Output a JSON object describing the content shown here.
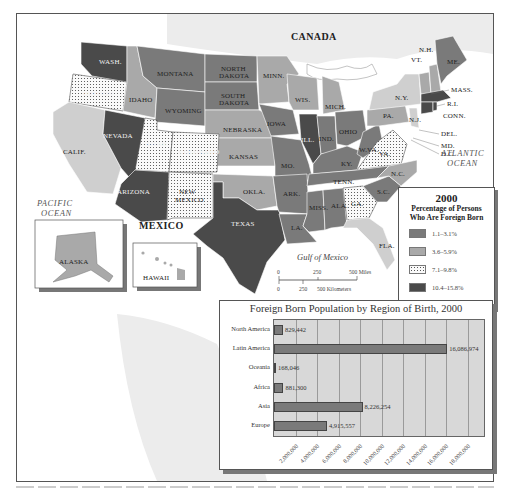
{
  "map": {
    "labels": {
      "canada": "CANADA",
      "mexico": "MEXICO",
      "pacific": [
        "PACIFIC",
        "OCEAN"
      ],
      "atlantic": [
        "ATLANTIC",
        "OCEAN"
      ],
      "gulf": "Gulf of Mexico"
    },
    "states": {
      "wash": "WASH.",
      "oregon": "OREGON",
      "idaho": "IDAHO",
      "montana": "MONTANA",
      "nd": [
        "NORTH",
        "DAKOTA"
      ],
      "sd": [
        "SOUTH",
        "DAKOTA"
      ],
      "wyoming": "WYOMING",
      "minn": "MINN.",
      "wis": "WIS.",
      "mich": "MICH.",
      "nevada": "NEVADA",
      "utah": "UTAH",
      "colorado": "COLORADO",
      "nebraska": "NEBRASKA",
      "kansas": "KANSAS",
      "iowa": "IOWA",
      "ill": "ILL.",
      "ind": "IND.",
      "ohio": "OHIO",
      "calif": "CALIF.",
      "arizona": "ARIZONA",
      "nm": [
        "NEW",
        "MEXICO"
      ],
      "okla": "OKLA.",
      "texas": "TEXAS",
      "mo": "MO.",
      "ark": "ARK.",
      "la": "LA.",
      "miss": "MISS.",
      "ala": "ALA.",
      "tenn": "TENN.",
      "ky": "KY.",
      "wva": "W.VA.",
      "va": "VA.",
      "nc": "N.C.",
      "sc": "S.C.",
      "ga": "GA.",
      "fla": "FLA.",
      "pa": "PA.",
      "ny": "N.Y.",
      "nj": "N.J.",
      "del": "DEL.",
      "md": "MD.",
      "dc": "D.C.",
      "conn": "CONN.",
      "ri": "R.I.",
      "mass": "MASS.",
      "vt": "VT.",
      "nh": "N.H.",
      "me": "ME.",
      "alaska": "ALASKA",
      "hawaii": "HAWAII"
    },
    "scale": {
      "miles": [
        "0",
        "250",
        "500 Miles"
      ],
      "km": [
        "0",
        "250",
        "500 Kilometers"
      ]
    }
  },
  "legend": {
    "title": "2000",
    "subtitle": [
      "Percentage of Persons",
      "Who Are Foreign Born"
    ],
    "items": [
      {
        "label": "1.1–3.1%",
        "color": "#7a7a7a"
      },
      {
        "label": "3.6–5.9%",
        "color": "#a9a9a9"
      },
      {
        "label": "7.1–9.8%",
        "color": "dotted"
      },
      {
        "label": "10.4–15.8%",
        "color": "#4a4a4a"
      },
      {
        "label": "16.7–26.2%",
        "color": "#cfcfcf"
      }
    ]
  },
  "chart_data": {
    "type": "bar",
    "orientation": "horizontal",
    "title": "Foreign Born Population by Region of Birth, 2000",
    "categories": [
      "North America",
      "Latin America",
      "Oceania",
      "Africa",
      "Asia",
      "Europe"
    ],
    "values": [
      829442,
      16086974,
      168046,
      881300,
      8226254,
      4915557
    ],
    "value_labels": [
      "829,442",
      "16,086,974",
      "168,046",
      "881,300",
      "8,226,254",
      "4,915,557"
    ],
    "xlim": [
      0,
      19500000
    ],
    "xticks": [
      "2,000,000",
      "4,000,000",
      "6,000,000",
      "8,000,000",
      "10,000,000",
      "12,000,000",
      "14,000,000",
      "16,000,000",
      "18,000,000"
    ],
    "xlabel": "",
    "ylabel": "",
    "grid": true,
    "legend": "none"
  }
}
